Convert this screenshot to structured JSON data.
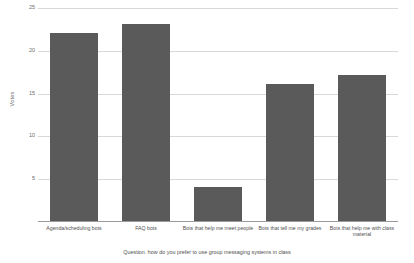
{
  "chart_data": {
    "type": "bar",
    "title": "",
    "categories": [
      "Agenda/scheduling bots",
      "FAQ bots",
      "Bots that help me meet people",
      "Bots that tell me my grades",
      "Bots that help me with class material"
    ],
    "values": [
      22,
      23,
      4,
      16,
      17
    ],
    "xlabel": "Question. how do you prefer to use group messaging systems in class",
    "ylabel": "Votes",
    "ylim": [
      0,
      25
    ],
    "yticks": [
      5,
      10,
      15,
      20,
      25
    ],
    "ytick_labels": [
      "5",
      "10",
      "15",
      "20",
      "25"
    ],
    "grid": true,
    "legend": false,
    "bar_color": "#5a5a5a",
    "grid_color": "#d8d8d8",
    "axis_color": "#9a9a9a",
    "background": "#ffffff"
  }
}
